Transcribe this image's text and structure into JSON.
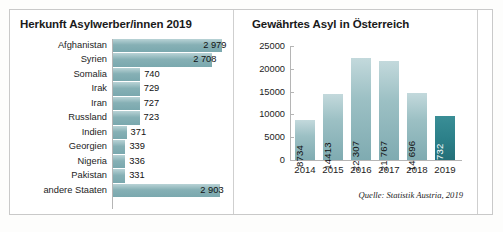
{
  "chart_data": [
    {
      "type": "bar",
      "orientation": "horizontal",
      "title": "Herkunft Asylwerber/innen 2019",
      "xlabel": "",
      "ylabel": "",
      "categories": [
        "Afghanistan",
        "Syrien",
        "Somalia",
        "Irak",
        "Iran",
        "Russland",
        "Indien",
        "Georgien",
        "Nigeria",
        "Pakistan",
        "andere Staaten"
      ],
      "values": [
        2979,
        2708,
        740,
        729,
        727,
        723,
        371,
        339,
        336,
        331,
        2903
      ],
      "value_labels": [
        "2 979",
        "2 708",
        "740",
        "729",
        "727",
        "723",
        "371",
        "339",
        "336",
        "331",
        "2 903"
      ],
      "label_placement": [
        "inside",
        "inside",
        "outside",
        "outside",
        "outside",
        "outside",
        "outside",
        "outside",
        "outside",
        "outside",
        "inside"
      ],
      "xlim": [
        0,
        3050
      ],
      "grid": false,
      "legend": null,
      "bar_color": "#8AB3B8"
    },
    {
      "type": "bar",
      "orientation": "vertical",
      "title": "Gewährtes Asyl in Österreich",
      "xlabel": "",
      "ylabel": "",
      "categories": [
        "2014",
        "2015",
        "2016",
        "2017",
        "2018",
        "2019"
      ],
      "values": [
        8734,
        14413,
        22307,
        21767,
        14696,
        9732
      ],
      "value_labels": [
        "8734",
        "14413",
        "22 307",
        "21 767",
        "14 696",
        "9 732"
      ],
      "yticks": [
        0,
        5000,
        10000,
        15000,
        20000,
        25000
      ],
      "ytick_labels": [
        "0",
        "5000",
        "10000",
        "15000",
        "20000",
        "25000"
      ],
      "ylim": [
        0,
        25000
      ],
      "grid": false,
      "legend": null,
      "bar_color": "#8AB3B8",
      "highlight_index": 5,
      "highlight_color": "#2B7F88",
      "source": "Quelle: Statistik Austria, 2019"
    }
  ],
  "left_panel": {
    "title": "Herkunft Asylwerber/innen 2019"
  },
  "right_panel": {
    "title": "Gewährtes Asyl in Österreich",
    "source": "Quelle: Statistik Austria, 2019"
  }
}
